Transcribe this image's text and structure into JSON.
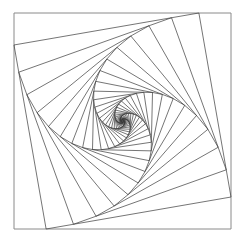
{
  "figure": {
    "square_count": 36,
    "interpolation_fraction": 0.148,
    "rotation_direction": "counter-clockwise inward",
    "stroke_color": "#3a3a3a",
    "outer_stroke_color": "#8a8a8a",
    "background_color": "#ffffff"
  }
}
